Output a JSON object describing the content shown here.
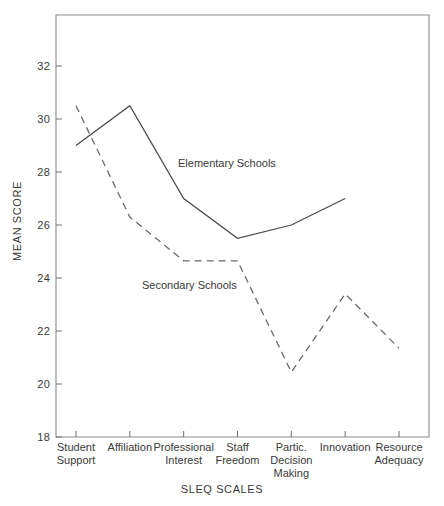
{
  "chart_data": {
    "type": "line",
    "title": "",
    "xlabel": "SLEQ SCALES",
    "ylabel": "MEAN SCORE",
    "ylim": [
      18,
      33
    ],
    "yticks": [
      18,
      20,
      22,
      24,
      26,
      28,
      30,
      32
    ],
    "grid": false,
    "legend_position": "inline-annotation",
    "categories": [
      "Student Support",
      "Affiliation",
      "Professional Interest",
      "Staff Freedom",
      "Partic. Decision Making",
      "Innovation",
      "Resource Adequacy"
    ],
    "series": [
      {
        "name": "Elementary Schools",
        "style": "solid",
        "values": [
          29.0,
          30.5,
          27.0,
          25.5,
          26.0,
          27.0,
          null
        ]
      },
      {
        "name": "Secondary Schools",
        "style": "dashed",
        "values": [
          30.5,
          26.3,
          24.65,
          24.65,
          20.45,
          23.4,
          21.35
        ]
      }
    ],
    "annotations": [
      {
        "text": "Elementary Schools",
        "series": "Elementary Schools"
      },
      {
        "text": "Secondary Schools",
        "series": "Secondary Schools"
      }
    ]
  },
  "axes": {
    "y_title": "MEAN SCORE",
    "x_title": "SLEQ SCALES",
    "y_tick_labels": [
      "32",
      "30",
      "28",
      "26",
      "24",
      "22",
      "20",
      "18"
    ],
    "x_tick_labels": [
      {
        "line1": "Student",
        "line2": "Support"
      },
      {
        "line1": "Affiliation",
        "line2": ""
      },
      {
        "line1": "Professional",
        "line2": "Interest"
      },
      {
        "line1": "Staff",
        "line2": "Freedom"
      },
      {
        "line1": "Partic.",
        "line2": "Decision",
        "line3": "Making"
      },
      {
        "line1": "Innovation",
        "line2": ""
      },
      {
        "line1": "Resource",
        "line2": "Adequacy"
      }
    ]
  },
  "labels": {
    "elementary": "Elementary Schools",
    "secondary": "Secondary Schools"
  },
  "colors": {
    "solid_series": "#4a4a4a",
    "dashed_series": "#6a6a6a",
    "frame": "#8a8a8a",
    "text": "#3a3a3a",
    "background": "#ffffff"
  }
}
